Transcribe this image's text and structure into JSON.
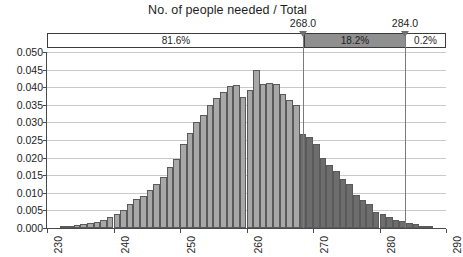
{
  "chart_data": {
    "type": "bar",
    "title": "No. of people needed / Total",
    "xlabel": "",
    "ylabel": "",
    "xlim": [
      230,
      290
    ],
    "ylim": [
      0.0,
      0.05
    ],
    "grid": true,
    "legend": "none",
    "x_ticks": [
      "230",
      "240",
      "250",
      "260",
      "270",
      "280",
      "290"
    ],
    "y_ticks": [
      "0.000",
      "0.005",
      "0.010",
      "0.015",
      "0.020",
      "0.025",
      "0.030",
      "0.035",
      "0.040",
      "0.045",
      "0.050"
    ],
    "bin_width": 1,
    "categories": [
      232,
      233,
      234,
      235,
      236,
      237,
      238,
      239,
      240,
      241,
      242,
      243,
      244,
      245,
      246,
      247,
      248,
      249,
      250,
      251,
      252,
      253,
      254,
      255,
      256,
      257,
      258,
      259,
      260,
      261,
      262,
      263,
      264,
      265,
      266,
      267,
      268,
      269,
      270,
      271,
      272,
      273,
      274,
      275,
      276,
      277,
      278,
      279,
      280,
      281,
      282,
      283,
      284,
      285,
      286,
      287
    ],
    "values": [
      0.0004,
      0.0006,
      0.0008,
      0.001,
      0.0014,
      0.0018,
      0.0024,
      0.003,
      0.004,
      0.0052,
      0.0068,
      0.0082,
      0.009,
      0.0108,
      0.0125,
      0.0145,
      0.0172,
      0.0196,
      0.024,
      0.027,
      0.0302,
      0.032,
      0.035,
      0.0368,
      0.0385,
      0.0403,
      0.0405,
      0.0372,
      0.0392,
      0.0448,
      0.0408,
      0.0412,
      0.0408,
      0.038,
      0.0365,
      0.035,
      0.0268,
      0.0258,
      0.0238,
      0.02,
      0.0178,
      0.0162,
      0.014,
      0.0125,
      0.0095,
      0.008,
      0.0068,
      0.0046,
      0.004,
      0.003,
      0.0024,
      0.002,
      0.0014,
      0.001,
      0.0006,
      0.0004
    ],
    "cut_points": [
      {
        "name": "lower-cut",
        "value": "268.0",
        "x": 268
      },
      {
        "name": "upper-cut",
        "value": "284.0",
        "x": 284
      }
    ],
    "regions": [
      {
        "name": "below-lower-cut",
        "label": "81.6%",
        "shade": "light"
      },
      {
        "name": "between-cuts",
        "label": "18.2%",
        "shade": "dark"
      },
      {
        "name": "above-upper-cut",
        "label": "0.2%",
        "shade": "light"
      }
    ],
    "colors": {
      "bar_light": "#a8a8a8",
      "bar_dark": "#6d6d6d",
      "bar_border": "#5a5a5a",
      "grid": "#c9c9c9",
      "axis": "#4a4a4a",
      "region_fill_dark": "#8f8f8f",
      "text": "#1d1d1d"
    }
  }
}
